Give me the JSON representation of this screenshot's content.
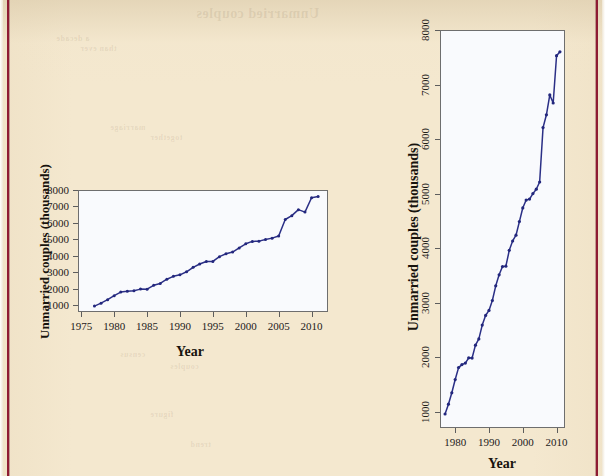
{
  "page": {
    "background_color": "#f4e8cf",
    "margin_rule_color": "#8e1b33",
    "bleed_through": [
      "Unmarried couples",
      "a decade",
      "than ever",
      "marriage",
      "together",
      "census",
      "couples",
      "figure",
      "trend"
    ]
  },
  "figures": [
    {
      "id": "left",
      "name": "unmarried-couples-wide-scale",
      "xlabel": "Year",
      "ylabel": "Unmarried couples (thousands)",
      "panel_bg": "#f9fafd",
      "line_color": "#2b2f86"
    },
    {
      "id": "right",
      "name": "unmarried-couples-tall-scale",
      "xlabel": "Year",
      "ylabel": "Unmarried couples (thousands)",
      "panel_bg": "#f9fafd",
      "line_color": "#2b2f86"
    }
  ],
  "chart_data": [
    {
      "type": "line",
      "id": "left",
      "title": "",
      "xlabel": "Year",
      "ylabel": "Unmarried couples (thousands)",
      "xlim": [
        1974.5,
        2012.5
      ],
      "ylim": [
        600,
        8000
      ],
      "xticks": [
        1975,
        1980,
        1985,
        1990,
        1995,
        2000,
        2005,
        2010
      ],
      "yticks": [
        1000,
        2000,
        3000,
        4000,
        5000,
        6000,
        7000,
        8000
      ],
      "grid": false,
      "legend": "none",
      "markers": true,
      "x": [
        1977,
        1978,
        1979,
        1980,
        1981,
        1982,
        1983,
        1984,
        1985,
        1986,
        1987,
        1988,
        1989,
        1990,
        1991,
        1992,
        1993,
        1994,
        1995,
        1996,
        1997,
        1998,
        1999,
        2000,
        2001,
        2002,
        2003,
        2004,
        2005,
        2006,
        2007,
        2008,
        2009,
        2010,
        2011
      ],
      "values": [
        957,
        1137,
        1346,
        1589,
        1808,
        1863,
        1891,
        1988,
        1983,
        2220,
        2334,
        2588,
        2764,
        2856,
        3039,
        3308,
        3510,
        3661,
        3668,
        3958,
        4130,
        4236,
        4486,
        4736,
        4881,
        4898,
        4999,
        5080,
        5212,
        6210,
        6445,
        6809,
        6661,
        7529,
        7600
      ]
    },
    {
      "type": "line",
      "id": "right",
      "title": "",
      "xlabel": "Year",
      "ylabel": "Unmarried couples (thousands)",
      "xlim": [
        1975.5,
        2012.5
      ],
      "ylim": [
        700,
        8000
      ],
      "xticks": [
        1980,
        1990,
        2000,
        2010
      ],
      "yticks": [
        1000,
        2000,
        3000,
        4000,
        5000,
        6000,
        7000,
        8000
      ],
      "grid": false,
      "legend": "none",
      "markers": true,
      "x": [
        1977,
        1978,
        1979,
        1980,
        1981,
        1982,
        1983,
        1984,
        1985,
        1986,
        1987,
        1988,
        1989,
        1990,
        1991,
        1992,
        1993,
        1994,
        1995,
        1996,
        1997,
        1998,
        1999,
        2000,
        2001,
        2002,
        2003,
        2004,
        2005,
        2006,
        2007,
        2008,
        2009,
        2010,
        2011
      ],
      "values": [
        957,
        1137,
        1346,
        1589,
        1808,
        1863,
        1891,
        1988,
        1983,
        2220,
        2334,
        2588,
        2764,
        2856,
        3039,
        3308,
        3510,
        3661,
        3668,
        3958,
        4130,
        4236,
        4486,
        4736,
        4881,
        4898,
        4999,
        5080,
        5212,
        6210,
        6445,
        6809,
        6661,
        7529,
        7600
      ]
    }
  ]
}
